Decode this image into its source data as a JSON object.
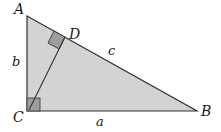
{
  "diagram": {
    "colors": {
      "fill": "#d3d3d3",
      "stroke": "#333333",
      "right_angle_fill": "#9e9e9e",
      "background": "#ffffff"
    },
    "vertices": {
      "A": {
        "label": "A",
        "x": 27,
        "y": 16
      },
      "B": {
        "label": "B",
        "x": 197,
        "y": 111
      },
      "C": {
        "label": "C",
        "x": 27,
        "y": 111
      },
      "D": {
        "label": "D",
        "x": 65,
        "y": 37
      }
    },
    "sides": {
      "a": {
        "label": "a",
        "between": [
          "B",
          "C"
        ]
      },
      "b": {
        "label": "b",
        "between": [
          "A",
          "C"
        ]
      },
      "c": {
        "label": "c",
        "between": [
          "A",
          "B"
        ]
      }
    },
    "segments": [
      {
        "name": "altitude",
        "from": "C",
        "to": "D"
      }
    ],
    "right_angles": [
      "C",
      "D"
    ]
  }
}
